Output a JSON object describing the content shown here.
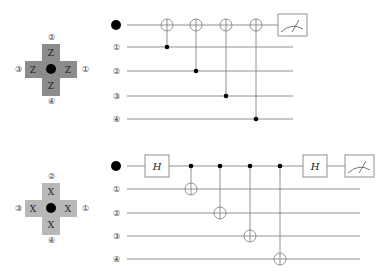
{
  "diagrams": [
    {
      "id": "z-stabilizer",
      "plaquette": {
        "operator": "Z",
        "fill": "#8c8c8c",
        "labels": {
          "top": "②",
          "right": "①",
          "bottom": "④",
          "left": "③"
        }
      },
      "circuit": {
        "wire_labels": [
          "●",
          "①",
          "②",
          "③",
          "④"
        ],
        "gates": [
          {
            "type": "CNOT",
            "control": 1,
            "target": 0
          },
          {
            "type": "CNOT",
            "control": 2,
            "target": 0
          },
          {
            "type": "CNOT",
            "control": 3,
            "target": 0
          },
          {
            "type": "CNOT",
            "control": 4,
            "target": 0
          },
          {
            "type": "Measure",
            "wire": 0
          }
        ]
      }
    },
    {
      "id": "x-stabilizer",
      "plaquette": {
        "operator": "X",
        "fill": "#b8b8b8",
        "labels": {
          "top": "②",
          "right": "①",
          "bottom": "④",
          "left": "③"
        }
      },
      "circuit": {
        "wire_labels": [
          "●",
          "①",
          "②",
          "③",
          "④"
        ],
        "gates": [
          {
            "type": "H",
            "wire": 0,
            "label": "H"
          },
          {
            "type": "CNOT",
            "control": 0,
            "target": 1
          },
          {
            "type": "CNOT",
            "control": 0,
            "target": 2
          },
          {
            "type": "CNOT",
            "control": 0,
            "target": 3
          },
          {
            "type": "CNOT",
            "control": 0,
            "target": 4
          },
          {
            "type": "H",
            "wire": 0,
            "label": "H"
          },
          {
            "type": "Measure",
            "wire": 0
          }
        ]
      }
    }
  ]
}
